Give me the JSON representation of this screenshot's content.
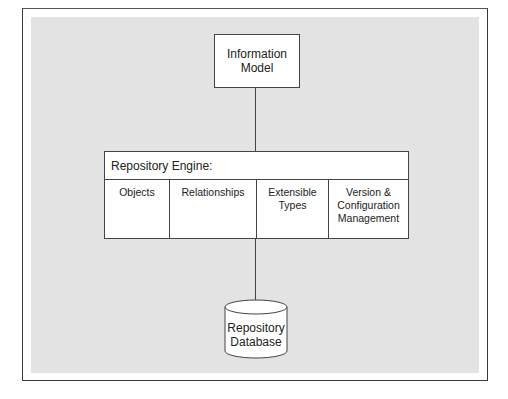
{
  "diagram": {
    "type": "architecture-block-diagram",
    "nodes": [
      {
        "id": "information_model",
        "label_lines": [
          "Information",
          "Model"
        ],
        "shape": "rectangle"
      },
      {
        "id": "repository_engine",
        "title": "Repository Engine:",
        "shape": "rectangle",
        "components": [
          {
            "id": "objects",
            "label_lines": [
              "Objects"
            ]
          },
          {
            "id": "relationships",
            "label_lines": [
              "Relationships"
            ]
          },
          {
            "id": "extensible_types",
            "label_lines": [
              "Extensible",
              "Types"
            ]
          },
          {
            "id": "version_config",
            "label_lines": [
              "Version &",
              "Configuration",
              "Management"
            ]
          }
        ]
      },
      {
        "id": "repository_database",
        "label_lines": [
          "Repository",
          "Database"
        ],
        "shape": "cylinder"
      }
    ],
    "edges": [
      {
        "from": "information_model",
        "to": "repository_engine"
      },
      {
        "from": "repository_engine",
        "to": "repository_database"
      }
    ],
    "colors": {
      "background": "#e3e3e3",
      "box_fill": "#ffffff",
      "stroke": "#444444",
      "frame": "#3a3a3a"
    }
  }
}
